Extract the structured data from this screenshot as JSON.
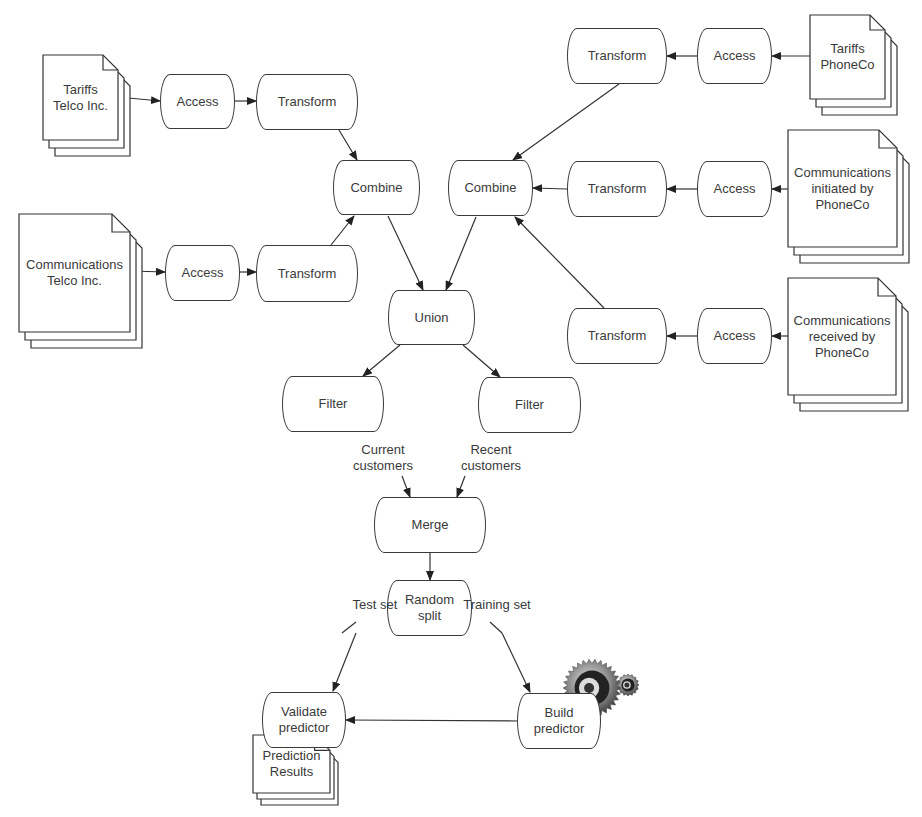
{
  "diagram": {
    "documents": [
      {
        "id": "tariffs_telco",
        "label": "Tariffs\nTelco Inc.",
        "x": 43,
        "y": 55,
        "w": 75,
        "h": 85
      },
      {
        "id": "comms_telco",
        "label": "Communications\nTelco Inc.",
        "x": 19,
        "y": 214,
        "w": 111,
        "h": 118
      },
      {
        "id": "tariffs_phoneco",
        "label": "Tariffs\nPhoneCo",
        "x": 810,
        "y": 15,
        "w": 75,
        "h": 84
      },
      {
        "id": "comms_initiated",
        "label": "Communications\ninitiated by\nPhoneCo",
        "x": 788,
        "y": 130,
        "w": 109,
        "h": 117
      },
      {
        "id": "comms_received",
        "label": "Communications\nreceived by\nPhoneCo",
        "x": 788,
        "y": 278,
        "w": 108,
        "h": 117
      },
      {
        "id": "prediction_results",
        "label": "Prediction\nResults",
        "x": 253,
        "y": 735,
        "w": 77,
        "h": 58
      }
    ],
    "processes": [
      {
        "id": "access1",
        "label": "Access",
        "x": 160,
        "y": 74,
        "w": 75,
        "h": 55
      },
      {
        "id": "transform1",
        "label": "Transform",
        "x": 256,
        "y": 74,
        "w": 102,
        "h": 56
      },
      {
        "id": "access2",
        "label": "Access",
        "x": 165,
        "y": 245,
        "w": 75,
        "h": 56
      },
      {
        "id": "transform2",
        "label": "Transform",
        "x": 256,
        "y": 245,
        "w": 102,
        "h": 57
      },
      {
        "id": "combine1",
        "label": "Combine",
        "x": 333,
        "y": 160,
        "w": 87,
        "h": 55
      },
      {
        "id": "combine2",
        "label": "Combine",
        "x": 448,
        "y": 160,
        "w": 85,
        "h": 56
      },
      {
        "id": "transform_r1",
        "label": "Transform",
        "x": 567,
        "y": 28,
        "w": 100,
        "h": 56
      },
      {
        "id": "access_r1",
        "label": "Access",
        "x": 697,
        "y": 28,
        "w": 75,
        "h": 56
      },
      {
        "id": "transform_r2",
        "label": "Transform",
        "x": 567,
        "y": 161,
        "w": 100,
        "h": 56
      },
      {
        "id": "access_r2",
        "label": "Access",
        "x": 697,
        "y": 161,
        "w": 75,
        "h": 56
      },
      {
        "id": "transform_r3",
        "label": "Transform",
        "x": 567,
        "y": 308,
        "w": 100,
        "h": 56
      },
      {
        "id": "access_r3",
        "label": "Access",
        "x": 697,
        "y": 308,
        "w": 75,
        "h": 56
      },
      {
        "id": "union",
        "label": "Union",
        "x": 388,
        "y": 290,
        "w": 87,
        "h": 55
      },
      {
        "id": "filter1",
        "label": "Filter",
        "x": 282,
        "y": 376,
        "w": 102,
        "h": 56
      },
      {
        "id": "filter2",
        "label": "Filter",
        "x": 478,
        "y": 377,
        "w": 103,
        "h": 56
      },
      {
        "id": "merge",
        "label": "Merge",
        "x": 374,
        "y": 497,
        "w": 112,
        "h": 56
      },
      {
        "id": "random_split",
        "label": "Random\nsplit",
        "x": 387,
        "y": 580,
        "w": 85,
        "h": 56
      },
      {
        "id": "validate",
        "label": "Validate\npredictor",
        "x": 262,
        "y": 692,
        "w": 84,
        "h": 56
      },
      {
        "id": "build",
        "label": "Build\npredictor",
        "x": 517,
        "y": 693,
        "w": 84,
        "h": 56
      }
    ],
    "edge_labels": [
      {
        "id": "current_customers",
        "label": "Current\ncustomers",
        "x": 338,
        "y": 442,
        "w": 90
      },
      {
        "id": "recent_customers",
        "label": "Recent\ncustomers",
        "x": 446,
        "y": 442,
        "w": 90
      },
      {
        "id": "test_set",
        "label": "Test set",
        "x": 340,
        "y": 597,
        "w": 70
      },
      {
        "id": "training_set",
        "label": "Training set",
        "x": 452,
        "y": 597,
        "w": 90
      }
    ],
    "edges": [
      [
        118,
        97,
        160,
        101
      ],
      [
        235,
        101,
        256,
        101
      ],
      [
        130,
        271,
        165,
        272
      ],
      [
        240,
        272,
        256,
        272
      ],
      [
        339,
        130,
        357,
        160
      ],
      [
        331,
        245,
        354,
        216
      ],
      [
        619,
        84,
        513,
        160
      ],
      [
        567,
        189,
        533,
        188
      ],
      [
        604,
        308,
        515,
        217
      ],
      [
        697,
        56,
        667,
        56
      ],
      [
        810,
        56,
        772,
        56
      ],
      [
        697,
        189,
        667,
        189
      ],
      [
        788,
        189,
        772,
        189
      ],
      [
        697,
        336,
        667,
        336
      ],
      [
        788,
        336,
        772,
        336
      ],
      [
        388,
        216,
        423,
        290
      ],
      [
        476,
        217,
        446,
        290
      ],
      [
        400,
        345,
        363,
        376
      ],
      [
        463,
        345,
        500,
        377
      ],
      [
        402,
        476,
        410,
        497
      ],
      [
        465,
        476,
        457,
        497
      ],
      [
        430,
        553,
        430,
        580
      ],
      [
        356,
        622,
        342,
        633
      ],
      [
        490,
        622,
        502,
        633
      ],
      [
        356,
        633,
        333,
        691
      ],
      [
        502,
        633,
        530,
        692
      ],
      [
        517,
        721,
        346,
        720
      ]
    ],
    "icon": {
      "name": "gears-icon",
      "x": 560,
      "y": 650
    }
  }
}
